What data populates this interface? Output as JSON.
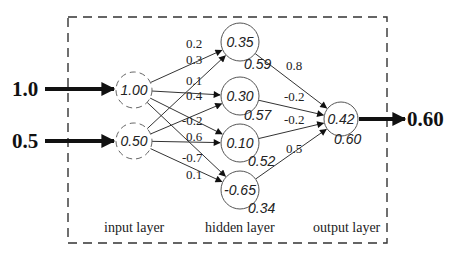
{
  "diagram": {
    "title": "",
    "inputs": [
      {
        "external_value": "1.0",
        "node_value": "1.00"
      },
      {
        "external_value": "0.5",
        "node_value": "0.50"
      }
    ],
    "hidden": [
      {
        "net_input": "0.35",
        "activation": "0.59"
      },
      {
        "net_input": "0.30",
        "activation": "0.57"
      },
      {
        "net_input": "0.10",
        "activation": "0.52"
      },
      {
        "net_input": "-0.65",
        "activation": "0.34"
      }
    ],
    "output": {
      "net_input": "0.42",
      "activation": "0.60",
      "external_value": "0.60"
    },
    "input_to_hidden_weights": [
      {
        "from": 0,
        "to": 0,
        "weight": "0.2"
      },
      {
        "from": 1,
        "to": 0,
        "weight": "0.3"
      },
      {
        "from": 0,
        "to": 1,
        "weight": "0.1"
      },
      {
        "from": 1,
        "to": 1,
        "weight": "0.4"
      },
      {
        "from": 0,
        "to": 2,
        "weight": "-0.2"
      },
      {
        "from": 1,
        "to": 2,
        "weight": "0.6"
      },
      {
        "from": 0,
        "to": 3,
        "weight": "-0.7"
      },
      {
        "from": 1,
        "to": 3,
        "weight": "0.1"
      }
    ],
    "hidden_to_output_weights": [
      {
        "from": 0,
        "weight": "0.8"
      },
      {
        "from": 1,
        "weight": "-0.2"
      },
      {
        "from": 2,
        "weight": "-0.2"
      },
      {
        "from": 3,
        "weight": "0.5"
      }
    ],
    "layer_labels": {
      "input": "input layer",
      "hidden": "hidden layer",
      "output": "output layer"
    },
    "colors": {
      "line": "#333333",
      "node_stroke": "#555555",
      "dashed_box": "#333333"
    }
  }
}
